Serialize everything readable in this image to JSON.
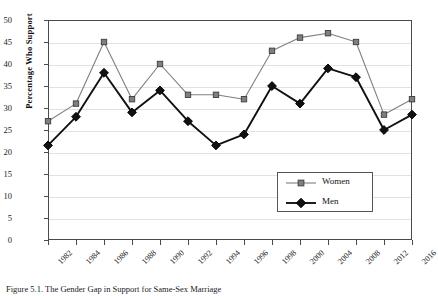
{
  "chart_data": {
    "type": "line",
    "title": "",
    "xlabel": "",
    "ylabel": "Percentage Who Support",
    "ylim": [
      0,
      50
    ],
    "ytick_step": 5,
    "yticks": [
      0,
      5,
      10,
      15,
      20,
      25,
      30,
      35,
      40,
      45,
      50
    ],
    "grid": true,
    "legend_position": "inside-lower-right",
    "categories": [
      "1982",
      "1984",
      "1986",
      "1988",
      "1990",
      "1992",
      "1994",
      "1996",
      "1998",
      "2000",
      "2004",
      "2008",
      "2012",
      "2016"
    ],
    "series": [
      {
        "name": "Women",
        "color": "#7f7f7f",
        "marker": "square",
        "values": [
          27,
          31,
          45,
          32,
          40,
          33,
          33,
          32,
          43,
          46,
          47,
          45,
          28.5,
          32
        ]
      },
      {
        "name": "Men",
        "color": "#111111",
        "marker": "diamond",
        "values": [
          21.5,
          28,
          38,
          29,
          34,
          27,
          21.5,
          24,
          35,
          31,
          39,
          37,
          25,
          28.5
        ]
      }
    ]
  },
  "legend": {
    "items": [
      {
        "label": "Women",
        "color": "#7f7f7f",
        "marker": "square"
      },
      {
        "label": "Men",
        "color": "#111111",
        "marker": "diamond"
      }
    ]
  },
  "caption": {
    "text": "Figure 5.1.  The Gender Gap in Support for Same-Sex Marriage"
  }
}
